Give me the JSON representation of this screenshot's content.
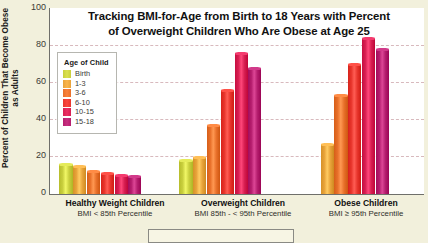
{
  "chart_data": {
    "type": "bar",
    "title": "Tracking BMI-for-Age from Birth to 18 Years with Percent of Overweight Children Who Are Obese at Age 25",
    "title_line1": "Tracking BMI-for-Age from Birth to 18 Years with Percent",
    "title_line2": "of Overweight Children Who Are Obese at Age 25",
    "xlabel": "",
    "ylabel": "Percent of Children That Become Obese as Adults",
    "ylim": [
      0,
      100
    ],
    "yticks": [
      100,
      80,
      60,
      40,
      20,
      0
    ],
    "grid": true,
    "legend_position": "inside-top-left",
    "legend_title": "Age of Child",
    "categories": [
      "Healthy Weight Children",
      "Overweight Children",
      "Obese Children"
    ],
    "category_sublabels": [
      "BMI < 85th Percentile",
      "BMI 85th - < 95th Percentile",
      "BMI ≥ 95th Percentile"
    ],
    "series": [
      {
        "name": "Birth",
        "color": "#c9cf3e",
        "values": [
          16,
          18,
          null
        ]
      },
      {
        "name": "1-3",
        "color": "#e8a33a",
        "values": [
          15,
          20,
          27
        ]
      },
      {
        "name": "3-6",
        "color": "#e8702a",
        "values": [
          12,
          37,
          53
        ]
      },
      {
        "name": "6-10",
        "color": "#e8352c",
        "values": [
          11,
          56,
          70
        ]
      },
      {
        "name": "10-15",
        "color": "#d81f52",
        "values": [
          10,
          76,
          84
        ]
      },
      {
        "name": "15-18",
        "color": "#b51e6e",
        "values": [
          9.5,
          68,
          78
        ]
      }
    ]
  },
  "axis": {
    "ytitle": "Percent of Children That Become Obese as Adults"
  }
}
